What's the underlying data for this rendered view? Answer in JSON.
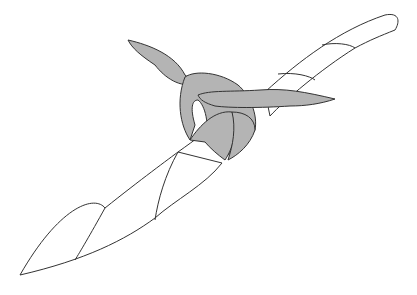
{
  "illustration": {
    "subject": "knot tied around a twisted rope",
    "colors": {
      "background": "#ffffff",
      "outline": "#333333",
      "rope_fill": "#ffffff",
      "tie_fill": "#b4b4b4"
    }
  }
}
